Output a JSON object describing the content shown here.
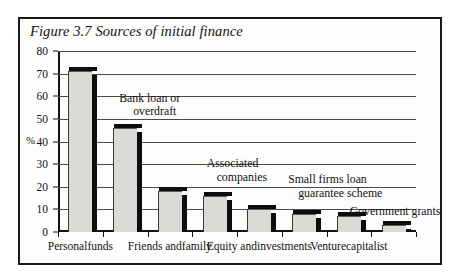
{
  "figure": {
    "title": "Figure 3.7  Sources of initial finance",
    "axis_unit_label": "%"
  },
  "chart_data": {
    "type": "bar",
    "title": "Figure 3.7  Sources of initial finance",
    "xlabel": "",
    "ylabel": "%",
    "ylim": [
      0,
      80
    ],
    "yticks": [
      0,
      10,
      20,
      30,
      40,
      50,
      60,
      70,
      80
    ],
    "ytick_labels": [
      "0",
      "10",
      "20",
      "30",
      "40",
      "50",
      "60",
      "70",
      "80"
    ],
    "grid": true,
    "legend": "none",
    "categories": [
      "Personal funds",
      "Bank loan or overdraft",
      "Friends and family",
      "Associated companies",
      "Equity and investments",
      "Small firms loan guarantee scheme",
      "Venture capitalist",
      "Government grants"
    ],
    "values": [
      71,
      46,
      18,
      16,
      10,
      8,
      7,
      3
    ],
    "bar_fill_color": "#d9d9d6",
    "bar_shadow_color": "#0d0d0d",
    "axis_color": "#111111"
  },
  "axis": {
    "ticks": [
      {
        "value": 80,
        "label": "80"
      },
      {
        "value": 70,
        "label": "70"
      },
      {
        "value": 60,
        "label": "60"
      },
      {
        "value": 50,
        "label": "50"
      },
      {
        "value": 40,
        "label": "40"
      },
      {
        "value": 30,
        "label": "30"
      },
      {
        "value": 20,
        "label": "20"
      },
      {
        "value": 10,
        "label": "10"
      },
      {
        "value": 0,
        "label": "0"
      }
    ]
  },
  "x_axis_labels": [
    {
      "line1": "Personal",
      "line2": "funds"
    },
    {
      "line1": "Friends and",
      "line2": "family"
    },
    {
      "line1": "Equity and",
      "line2": "investments"
    },
    {
      "line1": "Venture",
      "line2": "capitalist"
    }
  ],
  "annotations": [
    {
      "line1": "Bank loan or",
      "line2": "overdraft"
    },
    {
      "line1": "Associated",
      "line2": "companies"
    },
    {
      "line1": "Small firms loan",
      "line2": "guarantee scheme"
    },
    {
      "line1": "Government grants",
      "line2": ""
    }
  ]
}
